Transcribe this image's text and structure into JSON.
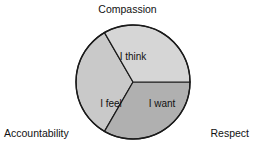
{
  "diagram": {
    "type": "trisected-circle",
    "title": "",
    "center": {
      "x": 133,
      "y": 82
    },
    "radius": 57,
    "outline_color": "#1a1a1a",
    "external_labels": [
      {
        "id": "compassion",
        "text": "Compassion",
        "position": "top"
      },
      {
        "id": "accountability",
        "text": "Accountability",
        "position": "bottom-left"
      },
      {
        "id": "respect",
        "text": "Respect",
        "position": "bottom-right"
      }
    ],
    "segments": [
      {
        "id": "i-think",
        "label": "I think",
        "position": "top",
        "color": "#c9c9c9",
        "start_angle": 210,
        "end_angle": 330,
        "label_x": 133,
        "label_y": 57
      },
      {
        "id": "i-feel",
        "label": "I feel",
        "position": "lower-left",
        "color": "#b0b0b0",
        "start_angle": 90,
        "end_angle": 210,
        "label_x": 111,
        "label_y": 104
      },
      {
        "id": "i-want",
        "label": "I want",
        "position": "lower-right",
        "color": "#d6d6d6",
        "start_angle": 330,
        "end_angle": 90,
        "label_x": 162,
        "label_y": 104
      }
    ]
  }
}
